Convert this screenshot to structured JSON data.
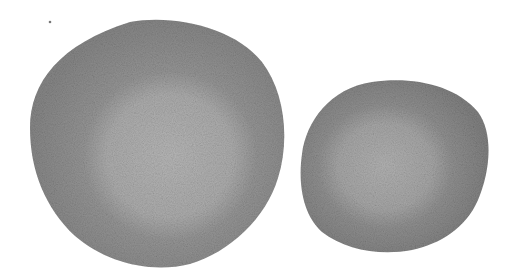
{
  "image": {
    "description": "Grayscale halftone scan of two rounded irregular blobs with lighter central regions on white background",
    "background_color": "#ffffff",
    "objects": [
      {
        "name": "large-blob",
        "fill_color": "#8c8c8c",
        "inner_color": "#b4b4b4",
        "bbox": [
          28,
          18,
          285,
          268
        ]
      },
      {
        "name": "small-blob",
        "fill_color": "#888888",
        "inner_color": "#b0b0b0",
        "bbox": [
          300,
          80,
          488,
          252
        ]
      }
    ],
    "speck": {
      "x": 50,
      "y": 22
    }
  }
}
